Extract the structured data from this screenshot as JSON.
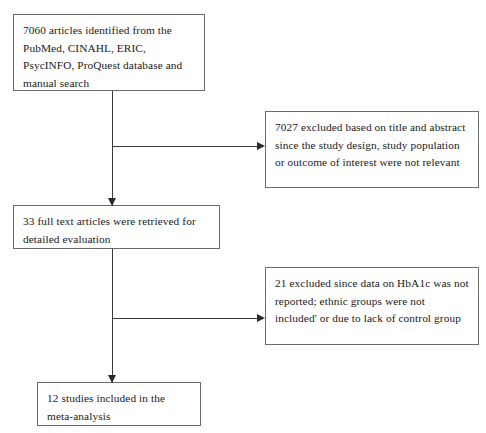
{
  "diagram": {
    "type": "flowchart",
    "background_color": "#ffffff",
    "border_color": "#6b6b6b",
    "line_color": "#3a3a3a",
    "nodes": {
      "identified": {
        "text": "7060 articles identified from the PubMed, CINAHL, ERIC, PsycINFO, ProQuest database and manual search",
        "count": "7060"
      },
      "excluded_title_abstract": {
        "text": "7027 excluded based on title and abstract since the study design, study population or outcome of interest were not relevant",
        "count": "7027"
      },
      "full_text_retrieved": {
        "text": "33 full text articles were retrieved for detailed evaluation",
        "count": "33"
      },
      "excluded_data": {
        "text": "21 excluded since data on HbA1c was not reported; ethnic groups were not included' or due to lack of control group",
        "count": "21"
      },
      "included": {
        "text": "12 studies included in the meta-analysis",
        "count": "12"
      }
    }
  }
}
